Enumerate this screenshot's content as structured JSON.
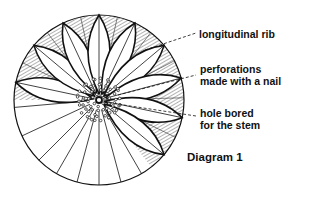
{
  "diagram": {
    "title": "Diagram 1",
    "labels": [
      {
        "id": "rib",
        "lines": [
          "longitudinal rib"
        ]
      },
      {
        "id": "perforations",
        "lines": [
          "perforations",
          "made with a nail"
        ]
      },
      {
        "id": "stem-hole",
        "lines": [
          "hole bored",
          "for the stem"
        ]
      }
    ],
    "geometry": {
      "center": [
        99,
        100
      ],
      "radius": 85,
      "petal_angles_deg": [
        168,
        140,
        115,
        90,
        65,
        40,
        15,
        -12,
        -40
      ],
      "radial_line_angles_deg": [
        -60,
        -75,
        -90,
        -105,
        -120,
        -135,
        -155,
        -175
      ]
    },
    "colors": {
      "ink": "#111111",
      "background": "#ffffff"
    }
  }
}
